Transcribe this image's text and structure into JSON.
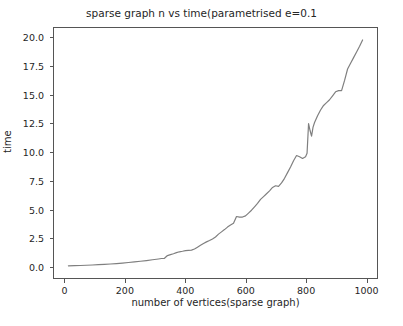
{
  "chart_data": {
    "type": "line",
    "title": "sparse graph n vs time(parametrised e=0.1",
    "xlabel": "number of vertices(sparse graph)",
    "ylabel": "time",
    "xlim": [
      -38,
      1038
    ],
    "ylim": [
      -1.05,
      20.9
    ],
    "xticks": [
      0,
      200,
      400,
      600,
      800,
      1000
    ],
    "xticklabels": [
      "0",
      "200",
      "400",
      "600",
      "800",
      "1000"
    ],
    "yticks": [
      0.0,
      2.5,
      5.0,
      7.5,
      10.0,
      12.5,
      15.0,
      17.5,
      20.0
    ],
    "yticklabels": [
      "0.0",
      "2.5",
      "5.0",
      "7.5",
      "10.0",
      "12.5",
      "15.0",
      "17.5",
      "20.0"
    ],
    "grid": false,
    "legend": null,
    "line_color": "#7f7f7f",
    "line_width": 1.2,
    "series": [
      {
        "name": "time",
        "x": [
          10,
          30,
          50,
          70,
          90,
          110,
          130,
          150,
          170,
          190,
          210,
          230,
          250,
          270,
          290,
          310,
          320,
          330,
          340,
          350,
          360,
          370,
          380,
          390,
          400,
          410,
          420,
          430,
          440,
          450,
          460,
          470,
          480,
          490,
          500,
          510,
          520,
          530,
          540,
          550,
          560,
          570,
          580,
          590,
          600,
          610,
          620,
          630,
          640,
          650,
          660,
          670,
          680,
          690,
          700,
          710,
          720,
          730,
          740,
          750,
          760,
          770,
          780,
          790,
          800,
          805,
          810,
          815,
          820,
          825,
          830,
          840,
          850,
          860,
          870,
          880,
          890,
          900,
          910,
          920,
          930,
          940,
          950,
          960,
          970,
          980,
          990
        ],
        "y": [
          0.02,
          0.03,
          0.05,
          0.07,
          0.09,
          0.12,
          0.15,
          0.18,
          0.22,
          0.26,
          0.31,
          0.36,
          0.42,
          0.48,
          0.55,
          0.62,
          0.66,
          0.68,
          0.92,
          1.0,
          1.08,
          1.18,
          1.25,
          1.3,
          1.36,
          1.38,
          1.4,
          1.5,
          1.66,
          1.82,
          1.98,
          2.12,
          2.24,
          2.38,
          2.55,
          2.8,
          3.0,
          3.2,
          3.42,
          3.6,
          3.75,
          4.35,
          4.3,
          4.3,
          4.4,
          4.65,
          4.9,
          5.2,
          5.5,
          5.85,
          6.1,
          6.35,
          6.6,
          6.9,
          7.05,
          7.0,
          7.3,
          7.7,
          8.2,
          8.7,
          9.25,
          9.7,
          9.6,
          9.45,
          9.6,
          9.9,
          12.5,
          11.9,
          11.4,
          12.2,
          12.6,
          13.2,
          13.7,
          14.1,
          14.35,
          14.6,
          14.95,
          15.3,
          15.4,
          15.4,
          16.3,
          17.3,
          17.8,
          18.3,
          18.8,
          19.3,
          19.85
        ]
      }
    ]
  }
}
